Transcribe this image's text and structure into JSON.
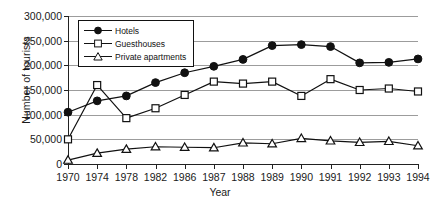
{
  "chart_data": {
    "type": "line",
    "title": "",
    "xlabel": "Year",
    "ylabel": "Number of tourists",
    "categories": [
      "1970",
      "1974",
      "1978",
      "1982",
      "1986",
      "1987",
      "1988",
      "1989",
      "1990",
      "1991",
      "1992",
      "1993",
      "1994"
    ],
    "ylim": [
      0,
      300000
    ],
    "ytick_labels": [
      "0",
      "50,000",
      "100,000",
      "150,000",
      "200,000",
      "250,000",
      "300,000"
    ],
    "ytick_values": [
      0,
      50000,
      100000,
      150000,
      200000,
      250000,
      300000
    ],
    "grid": true,
    "legend_position": "top-left-inside",
    "series": [
      {
        "name": "Hotels",
        "marker": "filled-circle",
        "values": [
          105000,
          128000,
          138000,
          165000,
          185000,
          198000,
          212000,
          240000,
          242000,
          238000,
          205000,
          206000,
          213000
        ]
      },
      {
        "name": "Guesthouses",
        "marker": "open-square",
        "values": [
          50000,
          160000,
          93000,
          113000,
          140000,
          167000,
          163000,
          167000,
          138000,
          172000,
          150000,
          153000,
          147000
        ]
      },
      {
        "name": "Private apartments",
        "marker": "open-triangle",
        "values": [
          8000,
          22000,
          30000,
          35000,
          34000,
          33000,
          43000,
          41000,
          52000,
          47000,
          44000,
          46000,
          37000
        ]
      }
    ]
  },
  "legend": {
    "items": [
      {
        "label": "Hotels"
      },
      {
        "label": "Guesthouses"
      },
      {
        "label": "Private apartments"
      }
    ]
  },
  "colors": {
    "axis": "#222222",
    "grid": "#9c9c9c",
    "series": "#111111",
    "background": "#ffffff"
  }
}
